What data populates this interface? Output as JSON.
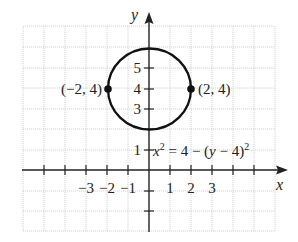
{
  "diagram": {
    "type": "coordinate-plane-circle",
    "axes": {
      "x_label": "x",
      "y_label": "y",
      "x_tick_labels": [
        "−3",
        "−2",
        "−1",
        "1",
        "2",
        "3"
      ],
      "y_tick_labels": [
        "1",
        "3",
        "4",
        "5"
      ]
    },
    "circle": {
      "center": [
        0,
        4
      ],
      "radius": 2,
      "equation_parts": {
        "x": "x",
        "x_exp": "2",
        "middle": " = 4 − (",
        "y": "y",
        "tail": " − 4)",
        "tail_exp": "2"
      }
    },
    "points": [
      {
        "label": "(−2, 4)",
        "x": -2,
        "y": 4
      },
      {
        "label": "(2, 4)",
        "x": 2,
        "y": 4
      }
    ],
    "colors": {
      "curve": "#111111",
      "grid": "#c9c9c9",
      "axis": "#222222"
    }
  }
}
